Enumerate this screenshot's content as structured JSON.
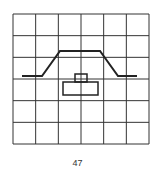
{
  "diagram": {
    "grid": {
      "x": 13,
      "y": 14,
      "width": 136,
      "height": 130,
      "cols": 6,
      "rows": 6,
      "stroke": "#333333"
    },
    "profile_line": {
      "points": [
        [
          22,
          76
        ],
        [
          42,
          76
        ],
        [
          60,
          51
        ],
        [
          100,
          51
        ],
        [
          118,
          76
        ],
        [
          137,
          76
        ]
      ],
      "stroke": "#222222"
    },
    "small_rect": {
      "x": 75,
      "y": 74,
      "width": 12,
      "height": 8
    },
    "large_rect": {
      "x": 63,
      "y": 82,
      "width": 35,
      "height": 13
    }
  },
  "footer": {
    "page_number": "47"
  }
}
